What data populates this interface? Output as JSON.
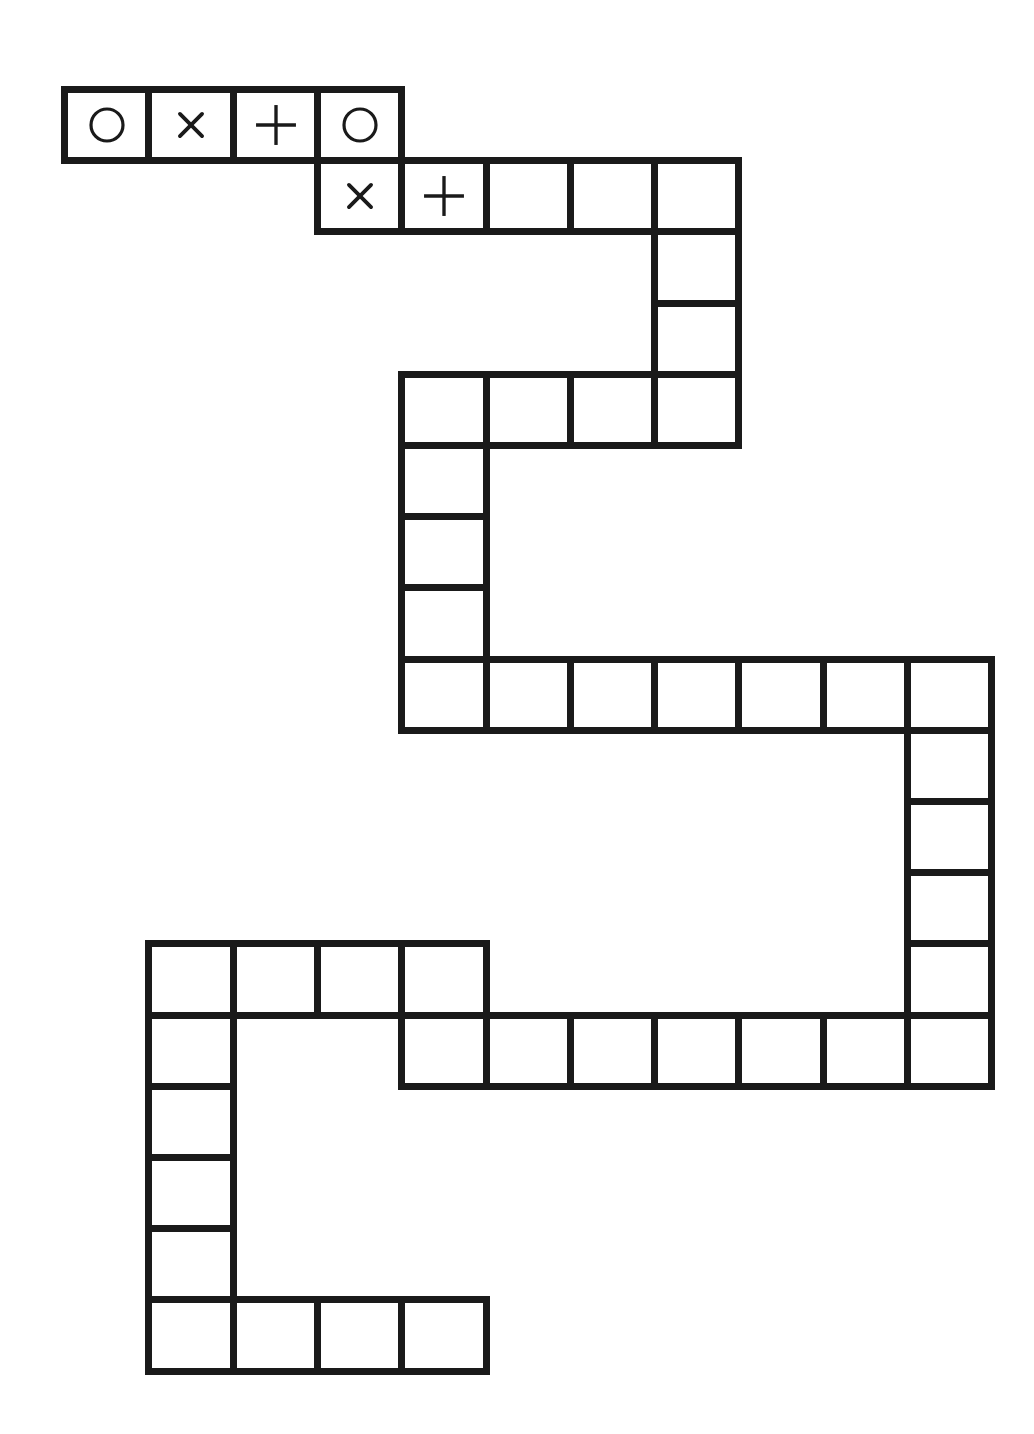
{
  "game": {
    "type": "path board",
    "grid": {
      "origin_x": 61,
      "origin_y": 86,
      "cell_w": 84.3,
      "cell_h": 71.2,
      "border": 7
    },
    "colors": {
      "line": "#1a1a1a",
      "background": "#ffffff"
    },
    "cells": [
      {
        "r": 0,
        "c": 0,
        "symbol": "circle"
      },
      {
        "r": 0,
        "c": 1,
        "symbol": "cross"
      },
      {
        "r": 0,
        "c": 2,
        "symbol": "plus"
      },
      {
        "r": 0,
        "c": 3,
        "symbol": "circle"
      },
      {
        "r": 1,
        "c": 3,
        "symbol": "cross"
      },
      {
        "r": 1,
        "c": 4,
        "symbol": "plus"
      },
      {
        "r": 1,
        "c": 5,
        "symbol": ""
      },
      {
        "r": 1,
        "c": 6,
        "symbol": ""
      },
      {
        "r": 1,
        "c": 7,
        "symbol": ""
      },
      {
        "r": 2,
        "c": 7,
        "symbol": ""
      },
      {
        "r": 3,
        "c": 7,
        "symbol": ""
      },
      {
        "r": 4,
        "c": 4,
        "symbol": ""
      },
      {
        "r": 4,
        "c": 5,
        "symbol": ""
      },
      {
        "r": 4,
        "c": 6,
        "symbol": ""
      },
      {
        "r": 4,
        "c": 7,
        "symbol": ""
      },
      {
        "r": 5,
        "c": 4,
        "symbol": ""
      },
      {
        "r": 6,
        "c": 4,
        "symbol": ""
      },
      {
        "r": 7,
        "c": 4,
        "symbol": ""
      },
      {
        "r": 8,
        "c": 4,
        "symbol": ""
      },
      {
        "r": 8,
        "c": 5,
        "symbol": ""
      },
      {
        "r": 8,
        "c": 6,
        "symbol": ""
      },
      {
        "r": 8,
        "c": 7,
        "symbol": ""
      },
      {
        "r": 8,
        "c": 8,
        "symbol": ""
      },
      {
        "r": 8,
        "c": 9,
        "symbol": ""
      },
      {
        "r": 8,
        "c": 10,
        "symbol": ""
      },
      {
        "r": 9,
        "c": 10,
        "symbol": ""
      },
      {
        "r": 10,
        "c": 10,
        "symbol": ""
      },
      {
        "r": 11,
        "c": 10,
        "symbol": ""
      },
      {
        "r": 12,
        "c": 10,
        "symbol": ""
      },
      {
        "r": 13,
        "c": 4,
        "symbol": ""
      },
      {
        "r": 13,
        "c": 5,
        "symbol": ""
      },
      {
        "r": 13,
        "c": 6,
        "symbol": ""
      },
      {
        "r": 13,
        "c": 7,
        "symbol": ""
      },
      {
        "r": 13,
        "c": 8,
        "symbol": ""
      },
      {
        "r": 13,
        "c": 9,
        "symbol": ""
      },
      {
        "r": 13,
        "c": 10,
        "symbol": ""
      },
      {
        "r": 12,
        "c": 1,
        "symbol": ""
      },
      {
        "r": 12,
        "c": 2,
        "symbol": ""
      },
      {
        "r": 12,
        "c": 3,
        "symbol": ""
      },
      {
        "r": 12,
        "c": 4,
        "symbol": ""
      },
      {
        "r": 13,
        "c": 1,
        "symbol": ""
      },
      {
        "r": 14,
        "c": 1,
        "symbol": ""
      },
      {
        "r": 15,
        "c": 1,
        "symbol": ""
      },
      {
        "r": 16,
        "c": 1,
        "symbol": ""
      },
      {
        "r": 17,
        "c": 1,
        "symbol": ""
      },
      {
        "r": 17,
        "c": 2,
        "symbol": ""
      },
      {
        "r": 17,
        "c": 3,
        "symbol": ""
      },
      {
        "r": 17,
        "c": 4,
        "symbol": ""
      }
    ]
  }
}
